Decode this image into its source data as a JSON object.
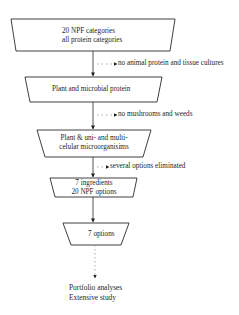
{
  "diagram": {
    "type": "flowchart-funnel",
    "steps": [
      {
        "line1": "20 NPF categories",
        "line2": "all protein categories"
      },
      {
        "line1": "Plant and microbial protein"
      },
      {
        "line1": "Plant & uni- and multi-",
        "line2": "celular microorganisims"
      },
      {
        "line1": "7 ingredients",
        "line2": "20 NPF options"
      },
      {
        "line1": "7 options"
      }
    ],
    "eliminations": [
      {
        "label": "no animal protein and tissue cultures"
      },
      {
        "label": "no mushrooms and weeds"
      },
      {
        "label": "several options eliminated"
      }
    ],
    "outcome": {
      "line1": "Portfolio analyses",
      "line2": "Extensive study"
    },
    "colors": {
      "stroke": "#2a2a2a",
      "dotted": "#8a8a8a",
      "background": "#ffffff"
    }
  }
}
